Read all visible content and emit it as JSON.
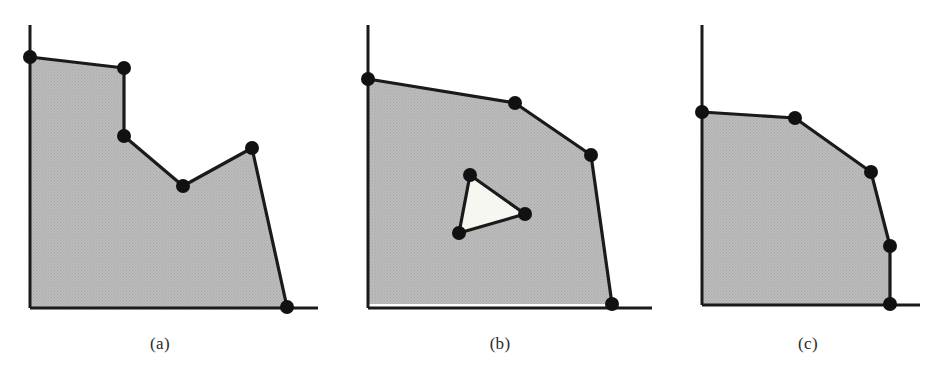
{
  "figure": {
    "background_color": "#ffffff",
    "line_color": "#1a1a1a",
    "fill_color": "#bdbdbd",
    "hole_fill_color": "#f7f7f2",
    "vertex_color": "#111111",
    "vertex_radius": 7,
    "stroke_width": 3.2,
    "axis_stroke_width": 3.0,
    "panels": [
      {
        "id": "a",
        "caption": "(a)",
        "caption_x": 160,
        "description": "non-convex staircase region with reflex vertices",
        "axis": {
          "y_axis": {
            "x": 30,
            "y_top": 25,
            "y_bottom": 308
          },
          "x_axis": {
            "y": 308,
            "x_left": 30,
            "x_right": 318
          }
        },
        "boundary": [
          {
            "x": 30,
            "y": 57,
            "vertex": true
          },
          {
            "x": 124,
            "y": 68,
            "vertex": true
          },
          {
            "x": 124,
            "y": 136,
            "vertex": true
          },
          {
            "x": 183,
            "y": 186,
            "vertex": true
          },
          {
            "x": 252,
            "y": 148,
            "vertex": true
          },
          {
            "x": 287,
            "y": 307,
            "vertex": true
          },
          {
            "x": 30,
            "y": 307,
            "vertex": false
          }
        ],
        "holes": []
      },
      {
        "id": "b",
        "caption": "(b)",
        "caption_x": 500,
        "description": "convex-ish region containing one triangular hole",
        "axis": {
          "y_axis": {
            "x": 368,
            "y_top": 25,
            "y_bottom": 308
          },
          "x_axis": {
            "y": 308,
            "x_left": 368,
            "x_right": 652
          }
        },
        "boundary": [
          {
            "x": 368,
            "y": 79,
            "vertex": true
          },
          {
            "x": 515,
            "y": 103,
            "vertex": true
          },
          {
            "x": 591,
            "y": 155,
            "vertex": true
          },
          {
            "x": 612,
            "y": 304,
            "vertex": true
          },
          {
            "x": 368,
            "y": 304,
            "vertex": false
          }
        ],
        "holes": [
          {
            "name": "triangular-hole",
            "points": [
              {
                "x": 470,
                "y": 175,
                "vertex": true
              },
              {
                "x": 525,
                "y": 214,
                "vertex": true
              },
              {
                "x": 459,
                "y": 233,
                "vertex": true
              }
            ]
          }
        ]
      },
      {
        "id": "c",
        "caption": "(c)",
        "caption_x": 808,
        "description": "convex region with rounded staircase corner",
        "axis": {
          "y_axis": {
            "x": 702,
            "y_top": 25,
            "y_bottom": 305
          },
          "x_axis": {
            "y": 305,
            "x_left": 702,
            "x_right": 920
          }
        },
        "boundary": [
          {
            "x": 702,
            "y": 112,
            "vertex": true
          },
          {
            "x": 795,
            "y": 118,
            "vertex": true
          },
          {
            "x": 871,
            "y": 172,
            "vertex": true
          },
          {
            "x": 890,
            "y": 246,
            "vertex": true
          },
          {
            "x": 890,
            "y": 304,
            "vertex": true
          },
          {
            "x": 702,
            "y": 304,
            "vertex": false
          }
        ],
        "holes": []
      }
    ]
  }
}
